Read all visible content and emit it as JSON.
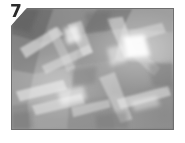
{
  "figure": {
    "index_label": "7",
    "alt_description": "Grayscale low-poly crumpled texture photograph",
    "panel": {
      "border_color": "#6e6e6e",
      "background_color": "#ffffff",
      "corner_cut": "top-left-diagonal"
    },
    "palette": {
      "label_color": "#2b2b2b",
      "highlight_white": "#ffffff",
      "light_gray": "#d8d8d8",
      "mid_gray": "#a0a0a0",
      "base_gray": "#8e8e8e",
      "dark_gray": "#6a6a6a",
      "shadow_gray": "#585858"
    }
  }
}
